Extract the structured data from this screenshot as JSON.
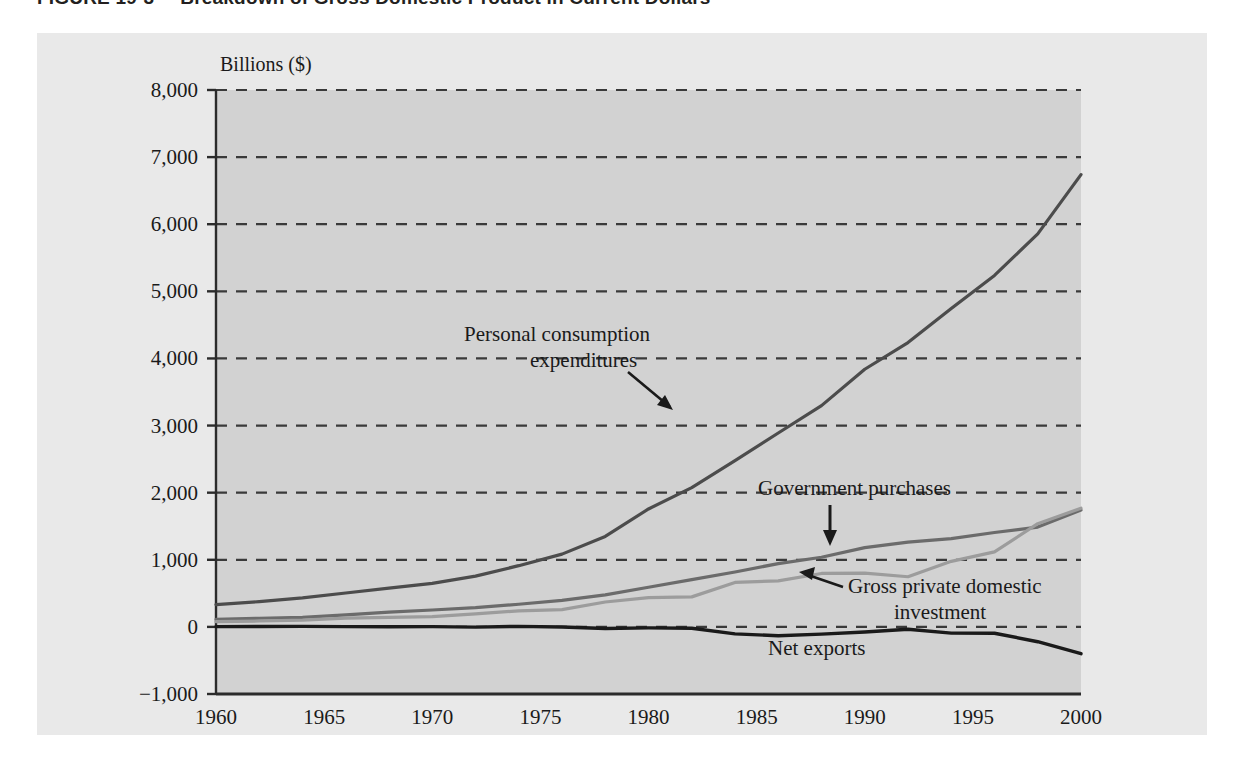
{
  "figure": {
    "number": "FIGURE 19-3",
    "title": "Breakdown of Gross Domestic Product in Current Dollars",
    "panel_color": "#e9e9e9",
    "plot_color": "#d2d2d2"
  },
  "chart_data": {
    "type": "line",
    "title": "Breakdown of Gross Domestic Product in Current Dollars",
    "xlabel": "",
    "ylabel": "Billions ($)",
    "ylim": [
      -1000,
      8000
    ],
    "xlim": [
      1960,
      2000
    ],
    "grid": true,
    "grid_style": "dashed-horizontal",
    "legend": "inline-annotations",
    "yticks": [
      "8,000",
      "7,000",
      "6,000",
      "5,000",
      "4,000",
      "3,000",
      "2,000",
      "1,000",
      "0",
      "-1,000"
    ],
    "ytick_values": [
      8000,
      7000,
      6000,
      5000,
      4000,
      3000,
      2000,
      1000,
      0,
      -1000
    ],
    "xticks": [
      "1960",
      "1965",
      "1970",
      "1975",
      "1980",
      "1985",
      "1990",
      "1995",
      "2000"
    ],
    "xtick_values": [
      1960,
      1965,
      1970,
      1975,
      1980,
      1985,
      1990,
      1995,
      2000
    ],
    "x": [
      1960,
      1962,
      1964,
      1966,
      1968,
      1970,
      1972,
      1974,
      1976,
      1978,
      1980,
      1982,
      1984,
      1986,
      1988,
      1990,
      1992,
      1994,
      1996,
      1998,
      2000
    ],
    "series": [
      {
        "name": "Personal consumption expenditures",
        "color": "#4c4c4c",
        "width": 3.2,
        "values": [
          332,
          376,
          432,
          505,
          578,
          648,
          757,
          912,
          1084,
          1348,
          1757,
          2076,
          2476,
          2889,
          3297,
          3839,
          4236,
          4743,
          5237,
          5856,
          6739
        ]
      },
      {
        "name": "Government purchases",
        "color": "#6b6b6b",
        "width": 3.2,
        "values": [
          113,
          129,
          143,
          178,
          220,
          252,
          286,
          337,
          396,
          478,
          590,
          704,
          818,
          943,
          1037,
          1181,
          1264,
          1314,
          1406,
          1487,
          1741
        ]
      },
      {
        "name": "Gross private domestic investment",
        "color": "#9c9c9c",
        "width": 3.2,
        "values": [
          78,
          88,
          102,
          131,
          142,
          152,
          195,
          239,
          257,
          371,
          437,
          447,
          662,
          686,
          796,
          802,
          747,
          977,
          1117,
          1538,
          1768
        ]
      },
      {
        "name": "Net exports",
        "color": "#1a1a1a",
        "width": 3.4,
        "values": [
          4,
          5,
          7,
          4,
          1,
          4,
          -3,
          8,
          -2,
          -24,
          -15,
          -20,
          -104,
          -132,
          -108,
          -77,
          -35,
          -93,
          -95,
          -221,
          -400
        ]
      }
    ],
    "annotations": [
      {
        "id": "personal-consumption",
        "lines": [
          "Personal consumption",
          "expenditures"
        ],
        "text": "Personal consumption expenditures",
        "arrow": "down-right"
      },
      {
        "id": "government-purchases",
        "lines": [
          "Government purchases"
        ],
        "text": "Government purchases",
        "arrow": "down"
      },
      {
        "id": "gross-private-domestic-investment",
        "lines": [
          "Gross private domestic",
          "investment"
        ],
        "text": "Gross private domestic investment",
        "arrow": "up-left"
      },
      {
        "id": "net-exports",
        "lines": [
          "Net exports"
        ],
        "text": "Net exports",
        "arrow": "none"
      }
    ]
  }
}
